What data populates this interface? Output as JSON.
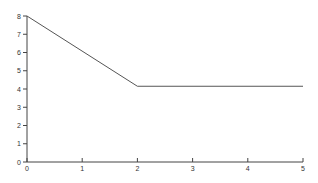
{
  "chart_data": {
    "type": "line",
    "title": "",
    "xlabel": "",
    "ylabel": "",
    "xlim": [
      0,
      5
    ],
    "ylim": [
      0,
      8
    ],
    "xticks": [
      "0",
      "1",
      "2",
      "3",
      "4",
      "5"
    ],
    "yticks": [
      "0",
      "1",
      "2",
      "3",
      "4",
      "5",
      "6",
      "7",
      "8"
    ],
    "grid": false,
    "legend": null,
    "series": [
      {
        "name": "series-1",
        "x": [
          0,
          2,
          5
        ],
        "y": [
          8,
          4.15,
          4.15
        ],
        "color": "#555555"
      }
    ]
  }
}
